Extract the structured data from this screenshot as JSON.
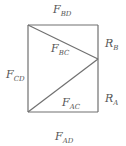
{
  "diagram": {
    "type": "truss free-body diagram",
    "colors": {
      "line": "#707070",
      "text": "#555555",
      "background": "#ffffff"
    },
    "nodes": {
      "C": {
        "x": 28,
        "y": 25
      },
      "D_top_right": {
        "x": 98,
        "y": 25
      },
      "B": {
        "x": 98,
        "y": 59
      },
      "A": {
        "x": 28,
        "y": 112
      },
      "D_bottom_right": {
        "x": 98,
        "y": 112
      }
    },
    "members": [
      {
        "id": "top",
        "label": "F",
        "sub": "BD"
      },
      {
        "id": "diag-upper",
        "label": "F",
        "sub": "BC"
      },
      {
        "id": "left",
        "label": "F",
        "sub": "CD"
      },
      {
        "id": "diag-lower",
        "label": "F",
        "sub": "AC"
      },
      {
        "id": "bottom",
        "label": "F",
        "sub": "AD"
      }
    ],
    "reactions": [
      {
        "id": "RB",
        "label": "R",
        "sub": "B"
      },
      {
        "id": "RA",
        "label": "R",
        "sub": "A"
      }
    ]
  }
}
